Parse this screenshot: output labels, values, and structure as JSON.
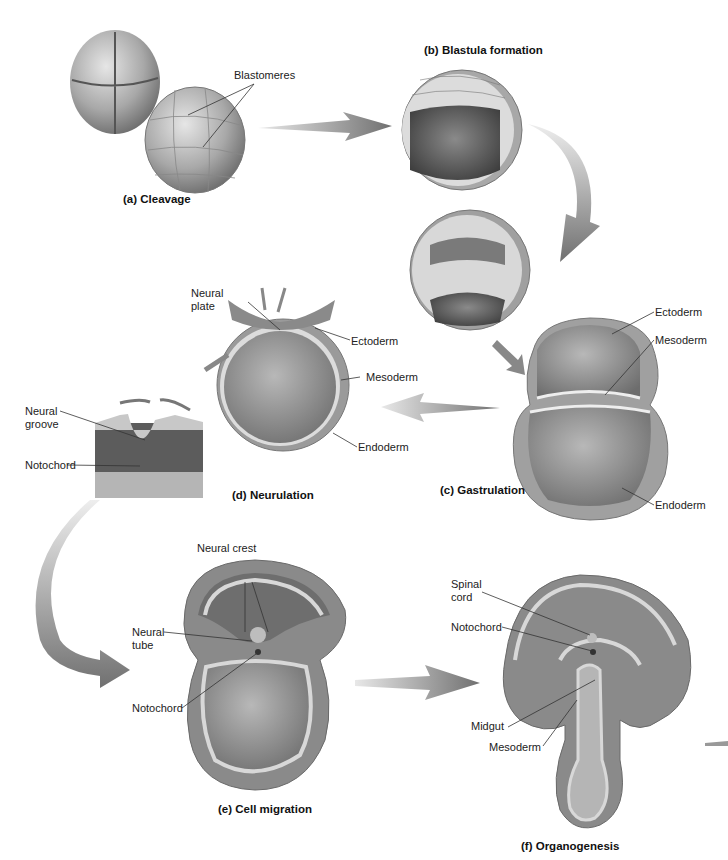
{
  "diagram": {
    "topic": "Stages of early embryonic development",
    "panels": [
      {
        "id": "a",
        "caption": "(a) Cleavage",
        "labels": [
          "Blastomeres"
        ]
      },
      {
        "id": "b",
        "caption": "(b) Blastula formation",
        "labels": []
      },
      {
        "id": "c",
        "caption": "(c) Gastrulation",
        "labels": [
          "Ectoderm",
          "Mesoderm",
          "Endoderm"
        ]
      },
      {
        "id": "d",
        "caption": "(d) Neurulation",
        "labels": [
          "Neural",
          "plate",
          "Ectoderm",
          "Mesoderm",
          "Endoderm",
          "Neural",
          "groove",
          "Notochord"
        ]
      },
      {
        "id": "e",
        "caption": "(e) Cell migration",
        "labels": [
          "Neural crest",
          "Neural",
          "tube",
          "Notochord"
        ]
      },
      {
        "id": "f",
        "caption": "(f) Organogenesis",
        "labels": [
          "Spinal",
          "cord",
          "Notochord",
          "Midgut",
          "Mesoderm"
        ]
      }
    ],
    "flow": [
      "a",
      "b",
      "c",
      "d",
      "e",
      "f"
    ]
  },
  "colors": {
    "background": "#ffffff",
    "tissue_dark": "#6e6e6e",
    "tissue_mid": "#9a9a9a",
    "tissue_light": "#cfcfcf",
    "arrow": "#7a7a7a",
    "label_text": "#222222",
    "leader_line": "#333333"
  }
}
